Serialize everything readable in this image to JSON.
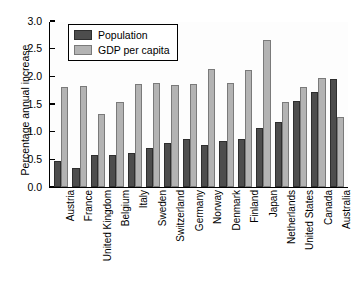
{
  "chart_data": {
    "type": "bar",
    "title": "",
    "xlabel": "",
    "ylabel": "Percentage annual increase",
    "ylim": [
      0.0,
      3.0
    ],
    "yticks": [
      "0.0",
      "0.5",
      "1.0",
      "1.5",
      "2.0",
      "2.5",
      "3.0"
    ],
    "ytick_values": [
      0.0,
      0.5,
      1.0,
      1.5,
      2.0,
      2.5,
      3.0
    ],
    "grid": false,
    "legend_position": "upper-left-inside",
    "categories": [
      "Austria",
      "France",
      "United Kingdom",
      "Belgium",
      "Italy",
      "Sweden",
      "Switzerland",
      "Germany",
      "Norway",
      "Denmark",
      "Finland",
      "Japan",
      "Netherlands",
      "United States",
      "Canada",
      "Australia"
    ],
    "series": [
      {
        "name": "Population",
        "color": "#4d4d4d",
        "values": [
          0.47,
          0.35,
          0.58,
          0.57,
          0.62,
          0.7,
          0.8,
          0.87,
          0.76,
          0.84,
          0.86,
          1.07,
          1.18,
          1.55,
          1.71,
          1.95
        ]
      },
      {
        "name": "GDP per capita",
        "color": "#b3b3b3",
        "values": [
          1.8,
          1.83,
          1.32,
          1.54,
          1.86,
          1.88,
          1.85,
          1.86,
          2.13,
          1.88,
          2.12,
          2.65,
          1.54,
          1.81,
          1.97,
          1.27
        ]
      }
    ]
  },
  "legend": {
    "items": [
      {
        "label": "Population",
        "color": "#4d4d4d"
      },
      {
        "label": "GDP per capita",
        "color": "#b3b3b3"
      }
    ]
  }
}
